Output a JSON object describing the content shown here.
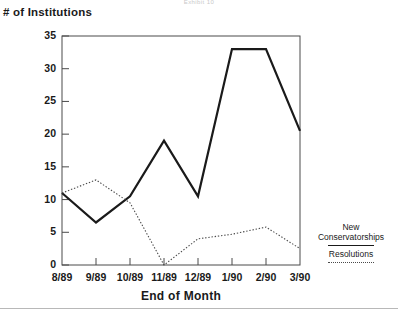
{
  "exhibit": {
    "label": "Exhibit 10"
  },
  "chart_data": {
    "type": "line",
    "title": "",
    "xlabel": "End of Month",
    "ylabel": "# of Institutions",
    "categories": [
      "8/89",
      "9/89",
      "10/89",
      "11/89",
      "12/89",
      "1/90",
      "2/90",
      "3/90"
    ],
    "series": [
      {
        "name": "New Conservatorships",
        "style": "solid",
        "color": "#1a1a1a",
        "values": [
          11,
          6.5,
          10.5,
          19,
          10.5,
          33,
          33,
          20.5
        ]
      },
      {
        "name": "Resolutions",
        "style": "dotted",
        "color": "#4a4a4a",
        "values": [
          11,
          13,
          9.5,
          0,
          4,
          4.7,
          5.8,
          2.5
        ]
      }
    ],
    "yticks": [
      0,
      5,
      10,
      15,
      20,
      25,
      30,
      35
    ],
    "ylim": [
      0,
      35
    ],
    "xlim": [
      0,
      7
    ],
    "grid": false,
    "legend_position": "right"
  },
  "legend": {
    "entries": [
      {
        "label_line1": "New",
        "label_line2": "Conservatorships",
        "swatch": "solid-line-swatch"
      },
      {
        "label_line1": "Resolutions",
        "label_line2": "",
        "swatch": "dotted-line-swatch"
      }
    ]
  }
}
